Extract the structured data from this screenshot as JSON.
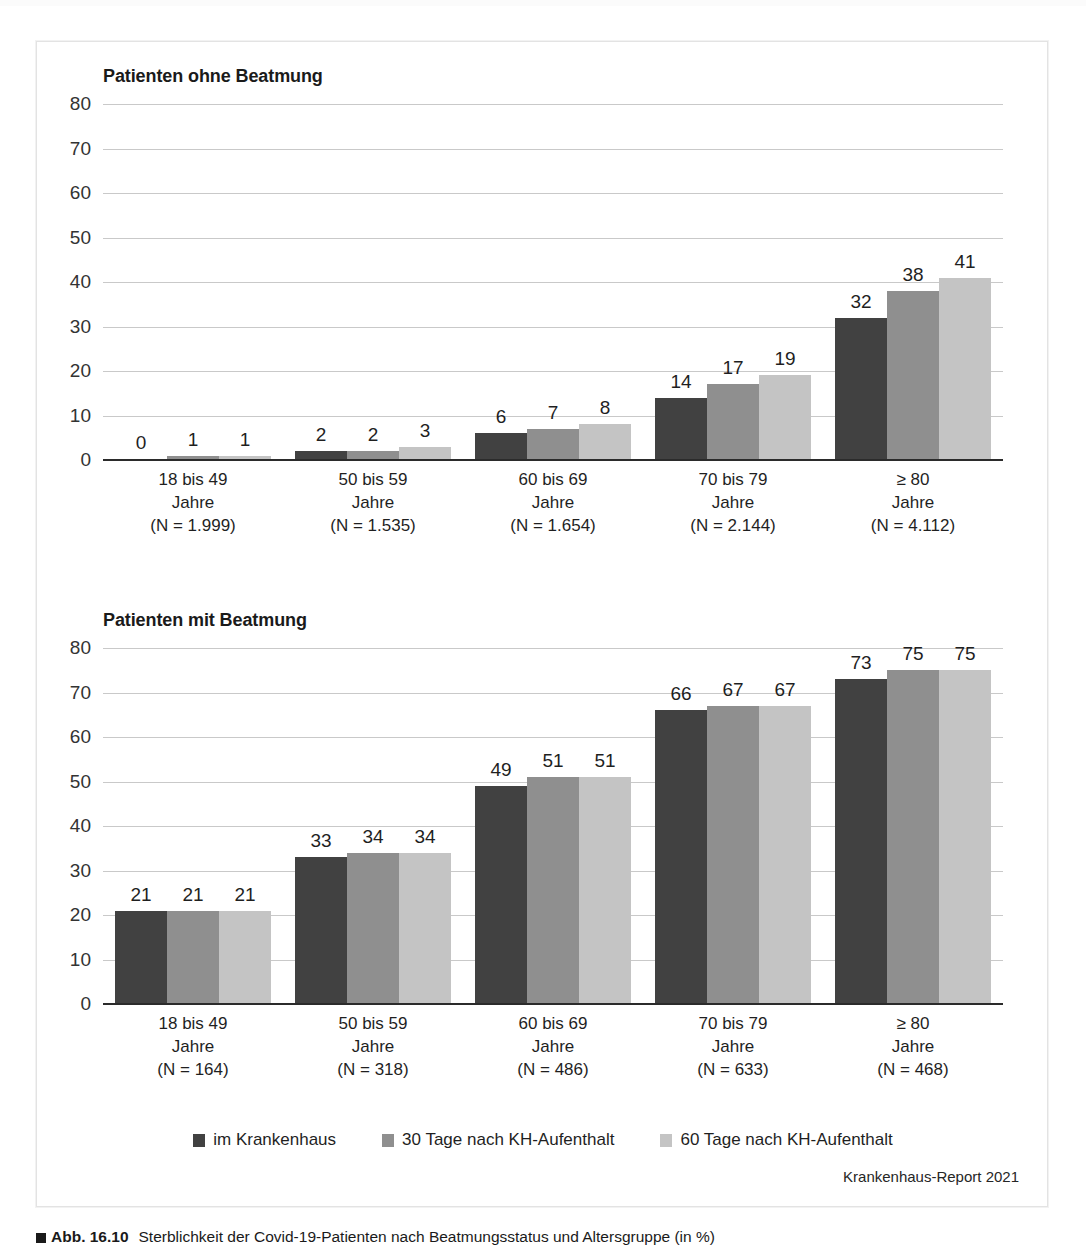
{
  "figure": {
    "caption_marker": "square-marker",
    "caption_number": "Abb. 16.10",
    "caption_text": "Sterblichkeit der Covid-19-Patienten nach Beatmungsstatus und Altersgruppe (in %)",
    "source_note": "Krankenhaus-Report 2021"
  },
  "legend": {
    "items": [
      {
        "label": "im Krankenhaus",
        "color": "#414141"
      },
      {
        "label": "30 Tage nach KH-Aufenthalt",
        "color": "#8f8f8f"
      },
      {
        "label": "60 Tage nach KH-Aufenthalt",
        "color": "#c4c4c4"
      }
    ]
  },
  "chart_data": [
    {
      "type": "bar",
      "title": "Patienten ohne Beatmung",
      "xlabel": "",
      "ylabel": "",
      "ylim": [
        0,
        80
      ],
      "yticks": [
        "0",
        "10",
        "20",
        "30",
        "40",
        "50",
        "60",
        "70",
        "80"
      ],
      "grid": true,
      "legend_position": "bottom",
      "categories": [
        "18 bis 49\nJahre\n(N = 1.999)",
        "50 bis 59\nJahre\n(N = 1.535)",
        "60 bis 69\nJahre\n(N = 1.654)",
        "70 bis 79\nJahre\n(N = 2.144)",
        "≥ 80\nJahre\n(N = 4.112)"
      ],
      "category_lines": [
        [
          "18 bis 49",
          "Jahre",
          "(N = 1.999)"
        ],
        [
          "50 bis 59",
          "Jahre",
          "(N = 1.535)"
        ],
        [
          "60 bis 69",
          "Jahre",
          "(N = 1.654)"
        ],
        [
          "70 bis 79",
          "Jahre",
          "(N = 2.144)"
        ],
        [
          "≥ 80",
          "Jahre",
          "(N = 4.112)"
        ]
      ],
      "series": [
        {
          "name": "im Krankenhaus",
          "color": "#414141",
          "values": [
            0,
            2,
            6,
            14,
            32
          ]
        },
        {
          "name": "30 Tage nach KH-Aufenthalt",
          "color": "#8f8f8f",
          "values": [
            1,
            2,
            7,
            17,
            38
          ]
        },
        {
          "name": "60 Tage nach KH-Aufenthalt",
          "color": "#c4c4c4",
          "values": [
            1,
            3,
            8,
            19,
            41
          ]
        }
      ]
    },
    {
      "type": "bar",
      "title": "Patienten mit Beatmung",
      "xlabel": "",
      "ylabel": "",
      "ylim": [
        0,
        80
      ],
      "yticks": [
        "0",
        "10",
        "20",
        "30",
        "40",
        "50",
        "60",
        "70",
        "80"
      ],
      "grid": true,
      "legend_position": "bottom",
      "categories": [
        "18 bis 49\nJahre\n(N = 164)",
        "50 bis 59\nJahre\n(N = 318)",
        "60 bis 69\nJahre\n(N = 486)",
        "70 bis 79\nJahre\n(N = 633)",
        "≥ 80\nJahre\n(N = 468)"
      ],
      "category_lines": [
        [
          "18 bis 49",
          "Jahre",
          "(N = 164)"
        ],
        [
          "50 bis 59",
          "Jahre",
          "(N = 318)"
        ],
        [
          "60 bis 69",
          "Jahre",
          "(N = 486)"
        ],
        [
          "70 bis 79",
          "Jahre",
          "(N = 633)"
        ],
        [
          "≥ 80",
          "Jahre",
          "(N = 468)"
        ]
      ],
      "series": [
        {
          "name": "im Krankenhaus",
          "color": "#414141",
          "values": [
            21,
            33,
            49,
            66,
            73
          ]
        },
        {
          "name": "30 Tage nach KH-Aufenthalt",
          "color": "#8f8f8f",
          "values": [
            21,
            34,
            51,
            67,
            75
          ]
        },
        {
          "name": "60 Tage nach KH-Aufenthalt",
          "color": "#c4c4c4",
          "values": [
            21,
            34,
            51,
            67,
            75
          ]
        }
      ]
    }
  ]
}
